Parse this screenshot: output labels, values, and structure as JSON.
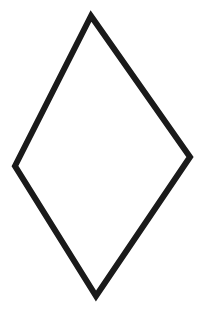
{
  "canvas": {
    "width": 203,
    "height": 314,
    "background_color": "#ffffff",
    "title": "Rhombus Outline"
  },
  "figure": {
    "name": "rhombus",
    "label": "Rhombus (diamond) outline",
    "shape_type": "polygon",
    "closed": true,
    "fill": "none",
    "stroke_color": "#1a1a1a",
    "stroke_width": 6,
    "vertex_count": 4,
    "vertices": [
      {
        "name": "top-vertex",
        "x": 91,
        "y": 16
      },
      {
        "name": "right-vertex",
        "x": 190,
        "y": 157
      },
      {
        "name": "bottom-vertex",
        "x": 96,
        "y": 296
      },
      {
        "name": "left-vertex",
        "x": 15,
        "y": 166
      }
    ],
    "points_string": "91,16 190,157 96,296 15,166",
    "edges": [
      {
        "name": "top-right-edge",
        "from": "top-vertex",
        "to": "right-vertex"
      },
      {
        "name": "bottom-right-edge",
        "from": "right-vertex",
        "to": "bottom-vertex"
      },
      {
        "name": "bottom-left-edge",
        "from": "bottom-vertex",
        "to": "left-vertex"
      },
      {
        "name": "top-left-edge",
        "from": "left-vertex",
        "to": "top-vertex"
      }
    ]
  }
}
